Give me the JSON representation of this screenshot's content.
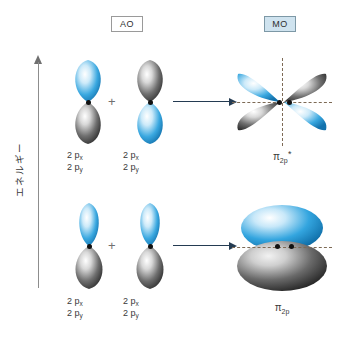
{
  "diagram": {
    "title_axis": "エネルギー",
    "columns": {
      "ao_label": "AO",
      "mo_label": "MO"
    },
    "operator_symbol": "+",
    "colors": {
      "lobe_blue": "#2196d9",
      "lobe_blue_light": "#bfe4f7",
      "lobe_gray": "#4a4a4a",
      "lobe_gray_light": "#d6d6d6",
      "arrow": "#243b52",
      "axis": "#8d8d8d",
      "node_dot": "#111111",
      "dashed_node_line": "#7d6a55",
      "mo_chip_fill": "#cfe3ef",
      "background": "#ffffff"
    },
    "rows": [
      {
        "id": "antibonding",
        "ao_left_caption_line1": "2 p",
        "ao_left_caption_sub1": "x",
        "ao_left_caption_line2": "2 p",
        "ao_left_caption_sub2": "y",
        "ao_right_caption_line1": "2 p",
        "ao_right_caption_sub1": "x",
        "ao_right_caption_line2": "2 p",
        "ao_right_caption_sub2": "y",
        "mo_caption_symbol": "π",
        "mo_caption_sub": "2p",
        "mo_caption_sup": "*",
        "phase_left": "blue-up-gray-down",
        "phase_right": "gray-up-blue-down",
        "combination": "out-of-phase"
      },
      {
        "id": "bonding",
        "ao_left_caption_line1": "2 p",
        "ao_left_caption_sub1": "x",
        "ao_left_caption_line2": "2 p",
        "ao_left_caption_sub2": "y",
        "ao_right_caption_line1": "2 p",
        "ao_right_caption_sub1": "x",
        "ao_right_caption_line2": "2 p",
        "ao_right_caption_sub2": "y",
        "mo_caption_symbol": "π",
        "mo_caption_sub": "2p",
        "mo_caption_sup": "",
        "phase_left": "blue-up-gray-down",
        "phase_right": "blue-up-gray-down",
        "combination": "in-phase"
      }
    ]
  }
}
